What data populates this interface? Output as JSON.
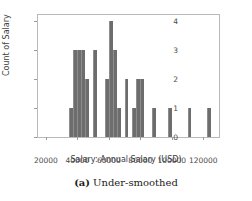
{
  "chart_data": {
    "type": "bar",
    "title": "",
    "subtitle": "",
    "xlabel": "Salary: Annual Salary (USD)",
    "ylabel": "Count of Salary",
    "xlim": [
      15000,
      130000
    ],
    "ylim": [
      0,
      4.2
    ],
    "grid": false,
    "legend": null,
    "bin_width": 2500,
    "xticks": [
      20000,
      40000,
      60000,
      80000,
      100000,
      120000
    ],
    "xtick_labels": [
      "20000",
      "40000",
      "60000",
      "80000",
      "100000",
      "120000"
    ],
    "yticks": [
      0,
      1,
      2,
      3,
      4
    ],
    "ytick_labels": [
      "0",
      "1",
      "2",
      "3",
      "4"
    ],
    "bar_color": "#6d6d6d",
    "bins": [
      {
        "x0": 35000,
        "x1": 37500,
        "value": 1
      },
      {
        "x0": 37500,
        "x1": 40000,
        "value": 3
      },
      {
        "x0": 40000,
        "x1": 42500,
        "value": 3
      },
      {
        "x0": 42500,
        "x1": 45000,
        "value": 3
      },
      {
        "x0": 45000,
        "x1": 47500,
        "value": 2
      },
      {
        "x0": 47500,
        "x1": 50000,
        "value": 0
      },
      {
        "x0": 50000,
        "x1": 52500,
        "value": 3
      },
      {
        "x0": 52500,
        "x1": 55000,
        "value": 0
      },
      {
        "x0": 55000,
        "x1": 57500,
        "value": 0
      },
      {
        "x0": 57500,
        "x1": 60000,
        "value": 2
      },
      {
        "x0": 60000,
        "x1": 62500,
        "value": 4
      },
      {
        "x0": 62500,
        "x1": 65000,
        "value": 3
      },
      {
        "x0": 65000,
        "x1": 67500,
        "value": 1
      },
      {
        "x0": 67500,
        "x1": 70000,
        "value": 0
      },
      {
        "x0": 70000,
        "x1": 72500,
        "value": 2
      },
      {
        "x0": 72500,
        "x1": 75000,
        "value": 0
      },
      {
        "x0": 75000,
        "x1": 77500,
        "value": 1
      },
      {
        "x0": 77500,
        "x1": 80000,
        "value": 2
      },
      {
        "x0": 80000,
        "x1": 82500,
        "value": 2
      },
      {
        "x0": 82500,
        "x1": 87500,
        "value": 0
      },
      {
        "x0": 87500,
        "x1": 90000,
        "value": 1
      },
      {
        "x0": 90000,
        "x1": 97500,
        "value": 0
      },
      {
        "x0": 97500,
        "x1": 100000,
        "value": 1
      },
      {
        "x0": 100000,
        "x1": 110000,
        "value": 0
      },
      {
        "x0": 110000,
        "x1": 112500,
        "value": 1
      },
      {
        "x0": 112500,
        "x1": 122500,
        "value": 0
      },
      {
        "x0": 122500,
        "x1": 125000,
        "value": 1
      }
    ]
  },
  "caption": {
    "tag": "(a)",
    "text": "Under-smoothed"
  }
}
